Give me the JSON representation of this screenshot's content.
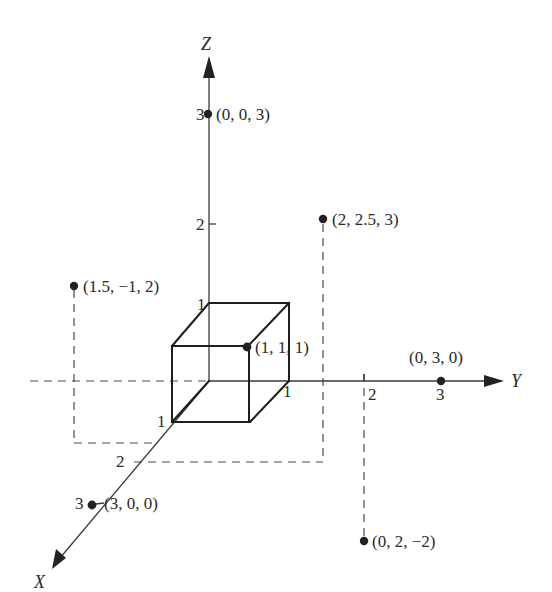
{
  "figure": {
    "type": "3d-coordinate-plot",
    "axes": {
      "x": {
        "label": "X",
        "ticks": [
          "1",
          "2",
          "3"
        ]
      },
      "y": {
        "label": "Y",
        "ticks": [
          "1",
          "2",
          "3"
        ]
      },
      "z": {
        "label": "Z",
        "ticks": [
          "1",
          "2",
          "3"
        ]
      }
    },
    "points": [
      {
        "id": "p-003",
        "label": "(0, 0, 3)",
        "coords": [
          0,
          0,
          3
        ]
      },
      {
        "id": "p-2-2.5-3",
        "label": "(2, 2.5, 3)",
        "coords": [
          2,
          2.5,
          3
        ]
      },
      {
        "id": "p-1.5-m1-2",
        "label": "(1.5, −1, 2)",
        "coords": [
          1.5,
          -1,
          2
        ]
      },
      {
        "id": "p-111",
        "label": "(1, 1, 1)",
        "coords": [
          1,
          1,
          1
        ]
      },
      {
        "id": "p-030",
        "label": "(0, 3, 0)",
        "coords": [
          0,
          3,
          0
        ]
      },
      {
        "id": "p-300",
        "label": "(3, 0, 0)",
        "coords": [
          3,
          0,
          0
        ]
      },
      {
        "id": "p-02m2",
        "label": "(0, 2, −2)",
        "coords": [
          0,
          2,
          -2
        ]
      }
    ],
    "shapes": [
      {
        "type": "unit-cube",
        "from": [
          0,
          0,
          0
        ],
        "to": [
          1,
          1,
          1
        ]
      }
    ]
  }
}
